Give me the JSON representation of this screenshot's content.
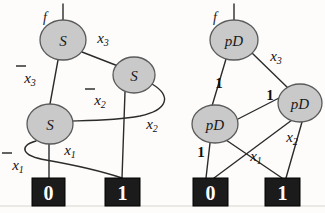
{
  "figure": {
    "background_color": "#fdfcfa",
    "node_fill": "#c9c9c9",
    "node_stroke": "#5a5a5a",
    "edge_color": "#2b2b2b",
    "terminal_fill": "#1b1b1b",
    "terminal_text_color": "#ffffff"
  },
  "left_graph": {
    "root_marker": "f",
    "nodes": [
      {
        "id": "s-top",
        "label": "S",
        "cx": 63,
        "cy": 40,
        "rx": 23,
        "ry": 20
      },
      {
        "id": "s-right",
        "label": "S",
        "cx": 134,
        "cy": 75,
        "rx": 21,
        "ry": 18
      },
      {
        "id": "s-left",
        "label": "S",
        "cx": 50,
        "cy": 124,
        "rx": 23,
        "ry": 20
      }
    ],
    "terminals": [
      {
        "id": "t0",
        "label": "0",
        "x": 32,
        "y": 178,
        "w": 33,
        "h": 28
      },
      {
        "id": "t1",
        "label": "1",
        "x": 105,
        "y": 178,
        "w": 35,
        "h": 28
      }
    ],
    "edge_labels": [
      {
        "id": "lbl-x3",
        "text": "x",
        "sub": "3",
        "negated": false,
        "x": 103,
        "y": 38
      },
      {
        "id": "lbl-notx3",
        "text": "x",
        "sub": "3",
        "negated": true,
        "x": 28,
        "y": 76
      },
      {
        "id": "lbl-notx2",
        "text": "x",
        "sub": "2",
        "negated": true,
        "x": 99,
        "y": 98
      },
      {
        "id": "lbl-x2",
        "text": "x",
        "sub": "2",
        "negated": false,
        "x": 151,
        "y": 124
      },
      {
        "id": "lbl-x1",
        "text": "x",
        "sub": "1",
        "negated": false,
        "x": 70,
        "y": 152
      },
      {
        "id": "lbl-notx1",
        "text": "x",
        "sub": "1",
        "negated": true,
        "x": 16,
        "y": 163
      }
    ]
  },
  "right_graph": {
    "root_marker": "f",
    "nodes": [
      {
        "id": "pd-top",
        "label": "pD",
        "cx": 234,
        "cy": 40,
        "rx": 24,
        "ry": 20
      },
      {
        "id": "pd-right",
        "label": "pD",
        "cx": 300,
        "cy": 103,
        "rx": 22,
        "ry": 19
      },
      {
        "id": "pd-left",
        "label": "pD",
        "cx": 215,
        "cy": 124,
        "rx": 23,
        "ry": 19
      }
    ],
    "terminals": [
      {
        "id": "t0",
        "label": "0",
        "x": 193,
        "y": 178,
        "w": 35,
        "h": 28
      },
      {
        "id": "t1",
        "label": "1",
        "x": 265,
        "y": 178,
        "w": 35,
        "h": 28
      }
    ],
    "edge_labels": [
      {
        "id": "lbl-x3",
        "text": "x",
        "sub": "3",
        "negated": false,
        "x": 275,
        "y": 56
      },
      {
        "id": "lbl-1a",
        "text": "1",
        "sub": "",
        "negated": false,
        "x": 219,
        "y": 83
      },
      {
        "id": "lbl-1b",
        "text": "1",
        "sub": "",
        "negated": false,
        "x": 270,
        "y": 95
      },
      {
        "id": "lbl-1c",
        "text": "1",
        "sub": "",
        "negated": false,
        "x": 201,
        "y": 152
      },
      {
        "id": "lbl-x2",
        "text": "x",
        "sub": "2",
        "negated": false,
        "x": 291,
        "y": 137
      },
      {
        "id": "lbl-x1",
        "text": "x",
        "sub": "1",
        "negated": false,
        "x": 255,
        "y": 156
      }
    ]
  }
}
